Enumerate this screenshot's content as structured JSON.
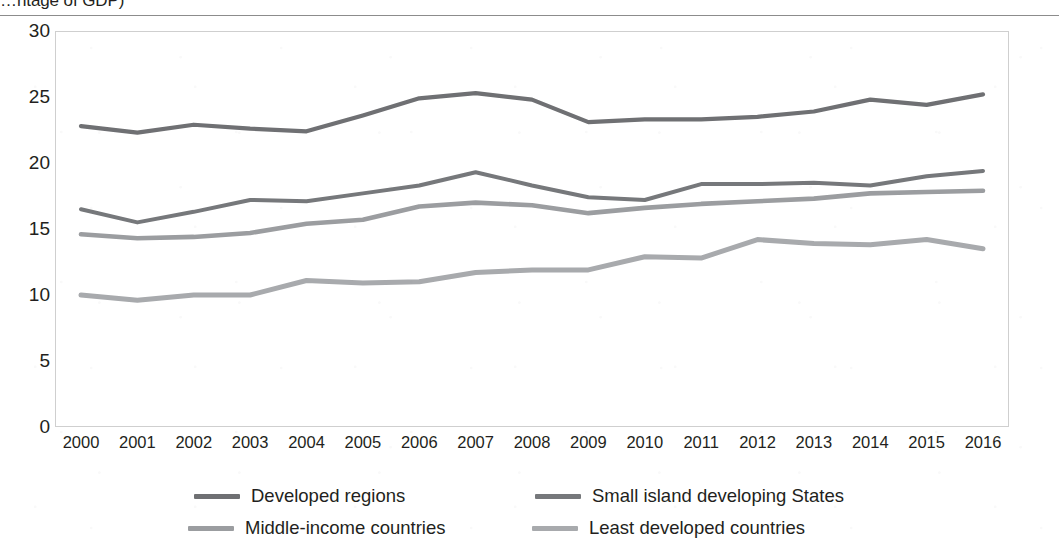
{
  "figure": {
    "title_clipped": "…ntage of GDP)",
    "title_full": "(Percentage of GDP)"
  },
  "chart_data": {
    "type": "line",
    "xlabel": "",
    "ylabel": "",
    "x": [
      2000,
      2001,
      2002,
      2003,
      2004,
      2005,
      2006,
      2007,
      2008,
      2009,
      2010,
      2011,
      2012,
      2013,
      2014,
      2015,
      2016
    ],
    "categories": [
      "2000",
      "2001",
      "2002",
      "2003",
      "2004",
      "2005",
      "2006",
      "2007",
      "2008",
      "2009",
      "2010",
      "2011",
      "2012",
      "2013",
      "2014",
      "2015",
      "2016"
    ],
    "ylim": [
      0,
      30
    ],
    "yticks": [
      0,
      5,
      10,
      15,
      20,
      25,
      30
    ],
    "ytick_labels": [
      "0",
      "5",
      "10",
      "15",
      "20",
      "25",
      "30"
    ],
    "grid": false,
    "legend_position": "bottom",
    "series": [
      {
        "name": "Developed regions",
        "color": "#6f7073",
        "values": [
          22.8,
          22.3,
          22.9,
          22.6,
          22.4,
          23.6,
          24.9,
          25.3,
          24.8,
          23.1,
          23.3,
          23.3,
          23.5,
          23.9,
          24.8,
          24.4,
          25.2
        ]
      },
      {
        "name": "Small island developing States",
        "color": "#76787b",
        "values": [
          16.5,
          15.5,
          16.3,
          17.2,
          17.1,
          17.7,
          18.3,
          19.3,
          18.3,
          17.4,
          17.2,
          18.4,
          18.4,
          18.5,
          18.3,
          19.0,
          19.4
        ]
      },
      {
        "name": "Middle-income countries",
        "color": "#9b9da0",
        "values": [
          14.6,
          14.3,
          14.4,
          14.7,
          15.4,
          15.7,
          16.7,
          17.0,
          16.8,
          16.2,
          16.6,
          16.9,
          17.1,
          17.3,
          17.7,
          17.8,
          17.9
        ]
      },
      {
        "name": "Least developed countries",
        "color": "#a8aaad",
        "values": [
          10.0,
          9.6,
          10.0,
          10.0,
          11.1,
          10.9,
          11.0,
          11.7,
          11.9,
          11.9,
          12.9,
          12.8,
          14.2,
          13.9,
          13.8,
          14.2,
          13.5
        ]
      }
    ]
  },
  "axes": {
    "y_ticks": [
      "30",
      "25",
      "20",
      "15",
      "10",
      "5",
      "0"
    ],
    "x_ticks": [
      "2000",
      "2001",
      "2002",
      "2003",
      "2004",
      "2005",
      "2006",
      "2007",
      "2008",
      "2009",
      "2010",
      "2011",
      "2012",
      "2013",
      "2014",
      "2015",
      "2016"
    ]
  },
  "legend": {
    "items": [
      {
        "label": "Developed regions",
        "color": "#6f7073"
      },
      {
        "label": "Small island developing States",
        "color": "#76787b"
      },
      {
        "label": "Middle-income countries",
        "color": "#9b9da0"
      },
      {
        "label": "Least developed countries",
        "color": "#a8aaad"
      }
    ]
  },
  "colors": {
    "text": "#231f20",
    "frame": "#cfcfcf",
    "rule": "#8c8c8c",
    "background": "#ffffff"
  }
}
